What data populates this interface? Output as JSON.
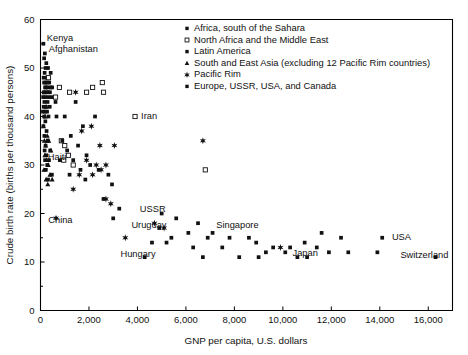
{
  "chart_data": {
    "type": "scatter",
    "title": "",
    "xlabel": "GNP per capita, U.S. dollars",
    "ylabel": "Crude birth rate (births per thousand persons)",
    "xlim": [
      0,
      17000
    ],
    "ylim": [
      0,
      60
    ],
    "xticks": [
      0,
      2000,
      4000,
      6000,
      8000,
      10000,
      12000,
      14000,
      16000
    ],
    "xticklabels": [
      "0",
      "2,000",
      "4,000",
      "6,000",
      "8,000",
      "10,000",
      "12,000",
      "14,000",
      "16,000"
    ],
    "yticks": [
      0,
      10,
      20,
      30,
      40,
      50,
      60
    ],
    "yticklabels": [
      "0",
      "10",
      "20",
      "30",
      "40",
      "50",
      "60"
    ],
    "grid": false,
    "legend_position": "upper-right-inside",
    "series": [
      {
        "name": "Africa, south of the Sahara",
        "marker": "filled-square",
        "points": [
          [
            120,
            55
          ],
          [
            180,
            53
          ],
          [
            150,
            52
          ],
          [
            240,
            51
          ],
          [
            310,
            50
          ],
          [
            210,
            50
          ],
          [
            170,
            49
          ],
          [
            420,
            49
          ],
          [
            130,
            48
          ],
          [
            260,
            48
          ],
          [
            330,
            48
          ],
          [
            200,
            47
          ],
          [
            150,
            47
          ],
          [
            280,
            47
          ],
          [
            360,
            47
          ],
          [
            190,
            46
          ],
          [
            230,
            46
          ],
          [
            300,
            46
          ],
          [
            420,
            46
          ],
          [
            480,
            46
          ],
          [
            140,
            45
          ],
          [
            250,
            45
          ],
          [
            310,
            45
          ],
          [
            390,
            45
          ],
          [
            110,
            44
          ],
          [
            200,
            44
          ],
          [
            330,
            44
          ],
          [
            460,
            44
          ],
          [
            160,
            43
          ],
          [
            290,
            43
          ],
          [
            620,
            43
          ],
          [
            130,
            42
          ],
          [
            220,
            42
          ],
          [
            380,
            42
          ],
          [
            100,
            41
          ],
          [
            180,
            41
          ],
          [
            270,
            41
          ],
          [
            150,
            40
          ],
          [
            330,
            40
          ],
          [
            660,
            40
          ],
          [
            200,
            39
          ],
          [
            120,
            38
          ],
          [
            250,
            37
          ],
          [
            160,
            36
          ],
          [
            300,
            35
          ],
          [
            210,
            34
          ],
          [
            170,
            33
          ],
          [
            400,
            33
          ],
          [
            240,
            32
          ],
          [
            190,
            31
          ],
          [
            350,
            31
          ],
          [
            280,
            30
          ],
          [
            220,
            29
          ],
          [
            470,
            28
          ],
          [
            310,
            27
          ]
        ]
      },
      {
        "name": "North Africa and the Middle East",
        "marker": "open-square",
        "points": [
          [
            330,
            48
          ],
          [
            780,
            46
          ],
          [
            1200,
            45
          ],
          [
            1900,
            45
          ],
          [
            2150,
            46
          ],
          [
            2550,
            47
          ],
          [
            2600,
            45
          ],
          [
            3900,
            40
          ],
          [
            620,
            44
          ],
          [
            860,
            35
          ],
          [
            1000,
            34
          ],
          [
            1150,
            32
          ],
          [
            960,
            31
          ],
          [
            6800,
            29
          ],
          [
            1350,
            30
          ]
        ]
      },
      {
        "name": "Latin America",
        "marker": "filled-square",
        "points": [
          [
            1000,
            40
          ],
          [
            1450,
            43
          ],
          [
            2250,
            40
          ],
          [
            1750,
            38
          ],
          [
            1250,
            36
          ],
          [
            900,
            35
          ],
          [
            1550,
            34
          ],
          [
            1100,
            33
          ],
          [
            1900,
            32
          ],
          [
            800,
            31
          ],
          [
            1350,
            31
          ],
          [
            2050,
            30
          ],
          [
            1650,
            29
          ],
          [
            2400,
            29
          ],
          [
            1200,
            28
          ],
          [
            2800,
            28
          ],
          [
            2600,
            23
          ],
          [
            3250,
            21
          ],
          [
            3000,
            19
          ],
          [
            1850,
            27
          ],
          [
            2950,
            26
          ]
        ]
      },
      {
        "name": "South and East Asia (excluding 12 Pacific Rim countries)",
        "marker": "filled-triangle",
        "points": [
          [
            150,
            45
          ],
          [
            230,
            42
          ],
          [
            190,
            40
          ],
          [
            120,
            38
          ],
          [
            280,
            36
          ],
          [
            160,
            35
          ],
          [
            340,
            35
          ],
          [
            210,
            34
          ],
          [
            430,
            33
          ],
          [
            180,
            32
          ],
          [
            250,
            31
          ],
          [
            320,
            30
          ],
          [
            140,
            29
          ],
          [
            390,
            28
          ],
          [
            230,
            27
          ],
          [
            480,
            27
          ],
          [
            300,
            26
          ],
          [
            270,
            35
          ]
        ]
      },
      {
        "name": "Pacific Rim",
        "marker": "star",
        "points": [
          [
            1450,
            45
          ],
          [
            2100,
            38
          ],
          [
            1700,
            37
          ],
          [
            2450,
            34
          ],
          [
            3050,
            34
          ],
          [
            6700,
            35
          ],
          [
            1900,
            31
          ],
          [
            2300,
            30
          ],
          [
            2700,
            30
          ],
          [
            2500,
            29
          ],
          [
            2150,
            28
          ],
          [
            1600,
            28
          ],
          [
            1350,
            25
          ],
          [
            2700,
            23
          ],
          [
            2900,
            22
          ],
          [
            4700,
            18
          ],
          [
            5100,
            17
          ],
          [
            3500,
            15
          ],
          [
            9900,
            13
          ],
          [
            640,
            19
          ]
        ]
      },
      {
        "name": "Europe, USSR, USA, and Canada",
        "marker": "filled-square",
        "points": [
          [
            5000,
            20
          ],
          [
            5600,
            19
          ],
          [
            6500,
            18
          ],
          [
            4900,
            17
          ],
          [
            6100,
            16
          ],
          [
            7100,
            16
          ],
          [
            5400,
            15
          ],
          [
            6900,
            15
          ],
          [
            7800,
            15
          ],
          [
            8600,
            15
          ],
          [
            4600,
            14
          ],
          [
            5200,
            14
          ],
          [
            6300,
            13
          ],
          [
            7500,
            13
          ],
          [
            8900,
            14
          ],
          [
            9600,
            13
          ],
          [
            10300,
            13
          ],
          [
            10900,
            14
          ],
          [
            11400,
            13
          ],
          [
            10100,
            12
          ],
          [
            9300,
            12
          ],
          [
            11900,
            12
          ],
          [
            12400,
            15
          ],
          [
            14100,
            15
          ],
          [
            13900,
            12
          ],
          [
            16300,
            11
          ],
          [
            11000,
            11
          ],
          [
            8200,
            11
          ],
          [
            10600,
            11
          ],
          [
            12700,
            12
          ],
          [
            6700,
            11
          ],
          [
            4300,
            11
          ],
          [
            9000,
            11
          ],
          [
            11600,
            16
          ]
        ]
      }
    ],
    "annotations": [
      {
        "text": "Kenya",
        "x": 260,
        "y": 56.2,
        "anchor": "start"
      },
      {
        "text": "Afghanistan",
        "x": 340,
        "y": 54.0,
        "anchor": "start"
      },
      {
        "text": "Haiti",
        "x": 300,
        "y": 31.6,
        "anchor": "start"
      },
      {
        "text": "China",
        "x": 320,
        "y": 18.6,
        "anchor": "start"
      },
      {
        "text": "Iran",
        "x": 4150,
        "y": 40.2,
        "anchor": "start"
      },
      {
        "text": "USSR",
        "x": 4100,
        "y": 21.0,
        "anchor": "start"
      },
      {
        "text": "Uruguay",
        "x": 3750,
        "y": 17.6,
        "anchor": "start"
      },
      {
        "text": "Hungary",
        "x": 3300,
        "y": 11.6,
        "anchor": "start"
      },
      {
        "text": "Singapore",
        "x": 7250,
        "y": 17.6,
        "anchor": "start"
      },
      {
        "text": "Japan",
        "x": 10400,
        "y": 11.8,
        "anchor": "start"
      },
      {
        "text": "USA",
        "x": 14500,
        "y": 15.2,
        "anchor": "start"
      },
      {
        "text": "Switzerland",
        "x": 14850,
        "y": 11.5,
        "anchor": "start"
      }
    ]
  },
  "legend": {
    "items": [
      {
        "label": "Africa, south of the Sahara",
        "marker": "filled-square"
      },
      {
        "label": "North Africa and the Middle East",
        "marker": "open-square"
      },
      {
        "label": "Latin America",
        "marker": "filled-square"
      },
      {
        "label": "South and East Asia (excluding 12 Pacific Rim countries)",
        "marker": "filled-triangle"
      },
      {
        "label": "Pacific Rim",
        "marker": "star"
      },
      {
        "label": "Europe, USSR, USA, and Canada",
        "marker": "filled-square"
      }
    ]
  }
}
